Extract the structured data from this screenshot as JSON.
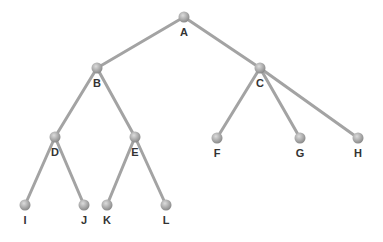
{
  "diagram": {
    "type": "tree",
    "nodes": [
      {
        "id": "A",
        "label": "A",
        "x": 184,
        "y": 17
      },
      {
        "id": "B",
        "label": "B",
        "x": 97,
        "y": 68
      },
      {
        "id": "C",
        "label": "C",
        "x": 260,
        "y": 68
      },
      {
        "id": "D",
        "label": "D",
        "x": 55,
        "y": 137
      },
      {
        "id": "E",
        "label": "E",
        "x": 135,
        "y": 137
      },
      {
        "id": "F",
        "label": "F",
        "x": 217,
        "y": 138
      },
      {
        "id": "G",
        "label": "G",
        "x": 300,
        "y": 138
      },
      {
        "id": "H",
        "label": "H",
        "x": 358,
        "y": 138
      },
      {
        "id": "I",
        "label": "I",
        "x": 25,
        "y": 205
      },
      {
        "id": "J",
        "label": "J",
        "x": 84,
        "y": 205
      },
      {
        "id": "K",
        "label": "K",
        "x": 107,
        "y": 205
      },
      {
        "id": "L",
        "label": "L",
        "x": 166,
        "y": 205
      }
    ],
    "edges": [
      [
        "A",
        "B"
      ],
      [
        "A",
        "C"
      ],
      [
        "B",
        "D"
      ],
      [
        "B",
        "E"
      ],
      [
        "C",
        "F"
      ],
      [
        "C",
        "G"
      ],
      [
        "C",
        "H"
      ],
      [
        "D",
        "I"
      ],
      [
        "D",
        "J"
      ],
      [
        "E",
        "K"
      ],
      [
        "E",
        "L"
      ]
    ],
    "colors": {
      "edge": "#a3a3a3",
      "node_light": "#d4d4d4",
      "node_dark": "#8a8a8a",
      "label": "#333333"
    }
  }
}
